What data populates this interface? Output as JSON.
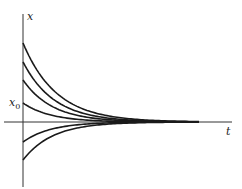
{
  "chart_data": {
    "type": "line",
    "title": "",
    "xlabel": "t",
    "ylabel": "x",
    "annotations": [
      {
        "text": "x",
        "subscript": "0",
        "position": "y-axis, initial value of third curve"
      }
    ],
    "grid": false,
    "legend": null,
    "axis": {
      "origin_px": [
        23,
        122
      ],
      "x_end_px": 232,
      "y_top_px": 14,
      "y_bottom_px": 187
    },
    "series": [
      {
        "name": "curve-1",
        "x0_px": 43,
        "decay": 0.03
      },
      {
        "name": "curve-2",
        "x0_px": 62,
        "decay": 0.032
      },
      {
        "name": "curve-3",
        "x0_px": 80,
        "decay": 0.034
      },
      {
        "name": "curve-x0",
        "x0_px": 103,
        "decay": 0.036
      },
      {
        "name": "curve-5",
        "x0_px": 142,
        "decay": 0.036
      },
      {
        "name": "curve-6",
        "x0_px": 160,
        "decay": 0.034
      }
    ]
  },
  "labels": {
    "x_axis": "t",
    "y_axis": "x",
    "x0_main": "x",
    "x0_sub": "0"
  },
  "colors": {
    "curve": "#1a1a1a",
    "axis": "#333333"
  }
}
